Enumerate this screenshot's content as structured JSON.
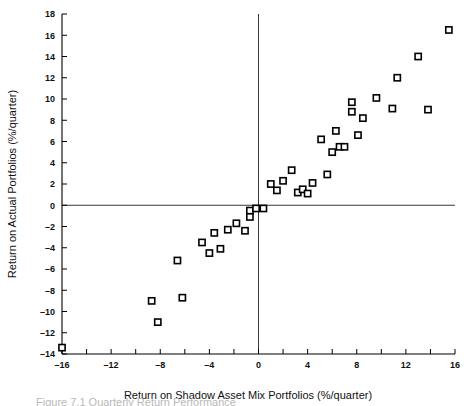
{
  "figure": {
    "caption_partial": "Figure 7.1  Quarterly Return Performance"
  },
  "chart_data": {
    "type": "scatter",
    "title": "",
    "xlabel": "Return on Shadow Asset Mix Portfolios (%/quarter)",
    "ylabel": "Return on Actual Portfolios (%/quarter)",
    "xlim": [
      -16,
      16
    ],
    "ylim": [
      -14,
      18
    ],
    "xticks": [
      -16,
      -14,
      -12,
      -10,
      -8,
      -6,
      -4,
      -2,
      0,
      2,
      4,
      6,
      8,
      10,
      12,
      14,
      16
    ],
    "xticklabels": [
      "-16",
      "",
      "-12",
      "",
      "-8",
      "",
      "-4",
      "",
      "0",
      "",
      "4",
      "",
      "8",
      "",
      "12",
      "",
      "16"
    ],
    "yticks": [
      -14,
      -12,
      -10,
      -8,
      -6,
      -4,
      -2,
      0,
      2,
      4,
      6,
      8,
      10,
      12,
      14,
      16,
      18
    ],
    "yticklabels": [
      "-14",
      "-12",
      "-10",
      "-8",
      "-6",
      "-4",
      "-2",
      "0",
      "2",
      "4",
      "6",
      "8",
      "10",
      "12",
      "14",
      "16",
      "18"
    ],
    "grid": false,
    "legend": false,
    "zero_lines": {
      "x": 0,
      "y": 0
    },
    "marker_style": "open-square",
    "points": [
      {
        "x": -16.0,
        "y": -13.4
      },
      {
        "x": -8.7,
        "y": -9.0
      },
      {
        "x": -8.2,
        "y": -11.0
      },
      {
        "x": -6.6,
        "y": -5.2
      },
      {
        "x": -6.2,
        "y": -8.7
      },
      {
        "x": -4.6,
        "y": -3.5
      },
      {
        "x": -4.0,
        "y": -4.5
      },
      {
        "x": -3.6,
        "y": -2.6
      },
      {
        "x": -3.1,
        "y": -4.1
      },
      {
        "x": -2.5,
        "y": -2.3
      },
      {
        "x": -1.8,
        "y": -1.7
      },
      {
        "x": -1.1,
        "y": -2.4
      },
      {
        "x": -0.7,
        "y": -0.5
      },
      {
        "x": -0.7,
        "y": -1.1
      },
      {
        "x": -0.2,
        "y": -0.3
      },
      {
        "x": 0.4,
        "y": -0.3
      },
      {
        "x": 1.0,
        "y": 2.0
      },
      {
        "x": 1.5,
        "y": 1.4
      },
      {
        "x": 2.0,
        "y": 2.3
      },
      {
        "x": 2.7,
        "y": 3.3
      },
      {
        "x": 3.2,
        "y": 1.2
      },
      {
        "x": 3.6,
        "y": 1.5
      },
      {
        "x": 4.0,
        "y": 1.1
      },
      {
        "x": 4.4,
        "y": 2.1
      },
      {
        "x": 5.1,
        "y": 6.2
      },
      {
        "x": 5.6,
        "y": 2.9
      },
      {
        "x": 6.0,
        "y": 5.0
      },
      {
        "x": 6.3,
        "y": 7.0
      },
      {
        "x": 6.6,
        "y": 5.5
      },
      {
        "x": 7.0,
        "y": 5.5
      },
      {
        "x": 7.6,
        "y": 9.7
      },
      {
        "x": 7.6,
        "y": 8.8
      },
      {
        "x": 8.1,
        "y": 6.6
      },
      {
        "x": 8.5,
        "y": 8.2
      },
      {
        "x": 9.6,
        "y": 10.1
      },
      {
        "x": 10.9,
        "y": 9.1
      },
      {
        "x": 11.3,
        "y": 12.0
      },
      {
        "x": 13.0,
        "y": 14.0
      },
      {
        "x": 13.8,
        "y": 9.0
      },
      {
        "x": 15.5,
        "y": 16.5
      }
    ]
  }
}
